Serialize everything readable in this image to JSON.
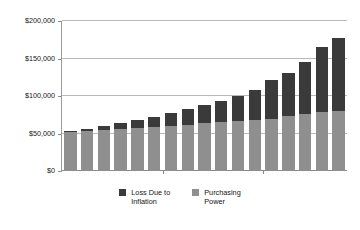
{
  "chart_data": {
    "type": "bar",
    "subtype": "stacked-column",
    "title": "",
    "xlabel": "",
    "ylabel": "",
    "ylim": [
      0,
      200000
    ],
    "grid": true,
    "legend_position": "bottom",
    "y_ticks": [
      "$0",
      "$50,000",
      "$100,000",
      "$150,000",
      "$200,000"
    ],
    "y_tick_values": [
      0,
      50000,
      100000,
      150000,
      200000
    ],
    "categories": [
      "1",
      "2",
      "3",
      "4",
      "5",
      "6",
      "7",
      "8",
      "9",
      "10",
      "11",
      "12",
      "13",
      "14",
      "15",
      "16",
      "17"
    ],
    "x_tick_labels": [],
    "series": [
      {
        "name": "Purchasing Power",
        "color": "#8f8f8f",
        "values": [
          52000,
          53000,
          54500,
          56000,
          57500,
          58500,
          60000,
          62000,
          64000,
          65500,
          67000,
          68500,
          70000,
          73000,
          76000,
          78500,
          80500
        ]
      },
      {
        "name": "Loss Due to Inflation",
        "color": "#3a3a3a",
        "values": [
          1000,
          2500,
          5000,
          7500,
          10000,
          14000,
          17500,
          20500,
          24000,
          28500,
          33500,
          39500,
          51000,
          58000,
          70000,
          87500,
          96500
        ]
      }
    ],
    "totals": [
      53000,
      55500,
      59500,
      63500,
      67500,
      72500,
      77500,
      82500,
      88000,
      94000,
      100500,
      108000,
      121000,
      131000,
      146000,
      166000,
      177000
    ]
  },
  "axis": {
    "y_labels": [
      {
        "text": "$200,000",
        "value": 200000
      },
      {
        "text": "$150,000",
        "value": 150000
      },
      {
        "text": "$100,000",
        "value": 100000
      },
      {
        "text": "$50,000",
        "value": 50000
      },
      {
        "text": "$0",
        "value": 0
      }
    ]
  },
  "legend": {
    "items": [
      {
        "label": "Loss Due to\nInflation",
        "color": "#3a3a3a",
        "icon": "square-swatch"
      },
      {
        "label": "Purchasing\nPower",
        "color": "#8f8f8f",
        "icon": "square-swatch"
      }
    ]
  },
  "colors": {
    "loss_due_to_inflation": "#3a3a3a",
    "purchasing_power": "#8f8f8f",
    "gridline": "#b9b9b9",
    "axis": "#8a8a8a",
    "background": "#ffffff",
    "text": "#181818"
  }
}
